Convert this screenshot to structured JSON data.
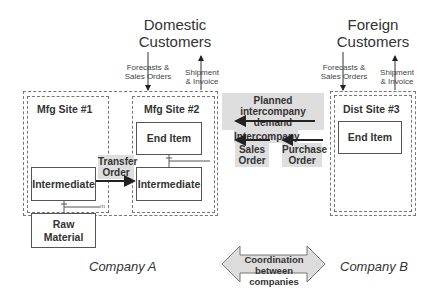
{
  "customers": {
    "domestic": {
      "line1": "Domestic",
      "line2": "Customers"
    },
    "foreign": {
      "line1": "Foreign",
      "line2": "Customers"
    }
  },
  "flows": {
    "forecasts_line1": "Forecasts &",
    "forecasts_line2": "Sales  Orders",
    "shipment_line1": "Shipment",
    "shipment_line2": "& Invoice"
  },
  "sites": {
    "mfg1": {
      "label": "Mfg Site #1",
      "items": [
        "Intermediate",
        "Raw Material"
      ]
    },
    "mfg2": {
      "label": "Mfg Site #2",
      "items": [
        "End Item",
        "Intermediate"
      ]
    },
    "dist3": {
      "label": "Dist Site #3",
      "items": [
        "End Item"
      ]
    }
  },
  "transfer_order": {
    "line1": "Transfer",
    "line2": "Order"
  },
  "intercompany": {
    "planned_line1": "Planned",
    "planned_line2": "intercompany demand",
    "intercompany": "Intercompany",
    "sales_line1": "Sales",
    "sales_line2": "Order",
    "purchase_line1": "Purchase",
    "purchase_line2": "Order"
  },
  "companies": {
    "a": "Company A",
    "b": "Company B"
  },
  "coordination": {
    "line1": "Coordination",
    "line2": "between companies"
  },
  "bom_marker": "m"
}
